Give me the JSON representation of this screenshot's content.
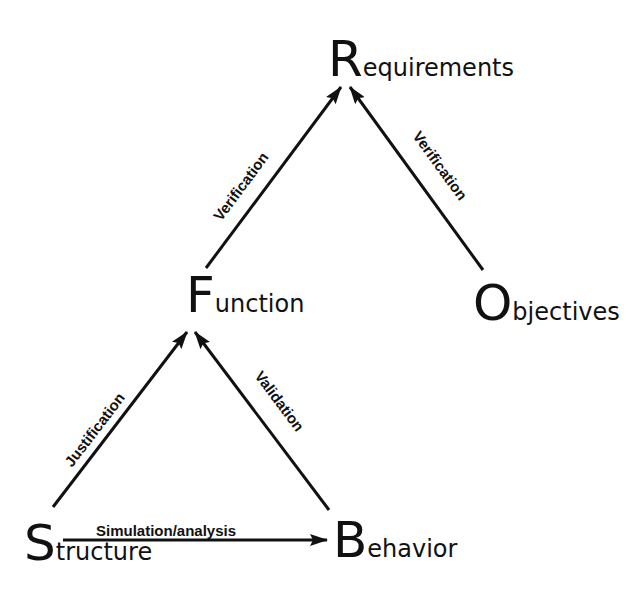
{
  "diagram": {
    "type": "concept-graph",
    "colors": {
      "ink": "#111111",
      "background": "#ffffff"
    },
    "nodes": {
      "requirements": {
        "cap": "R",
        "rest": "equirements",
        "full": "Requirements"
      },
      "function": {
        "cap": "F",
        "rest": "unction",
        "full": "Function"
      },
      "objectives": {
        "cap": "O",
        "rest": "bjectives",
        "full": "Objectives"
      },
      "structure": {
        "cap": "S",
        "rest": "tructure",
        "full": "Structure"
      },
      "behavior": {
        "cap": "B",
        "rest": "ehavior",
        "full": "Behavior"
      }
    },
    "edges": [
      {
        "from": "Function",
        "to": "Requirements",
        "label": "Verification"
      },
      {
        "from": "Objectives",
        "to": "Requirements",
        "label": "Verification"
      },
      {
        "from": "Structure",
        "to": "Function",
        "label": "Justification"
      },
      {
        "from": "Behavior",
        "to": "Function",
        "label": "Validation"
      },
      {
        "from": "Structure",
        "to": "Behavior",
        "label": "Simulation/analysis"
      }
    ]
  }
}
